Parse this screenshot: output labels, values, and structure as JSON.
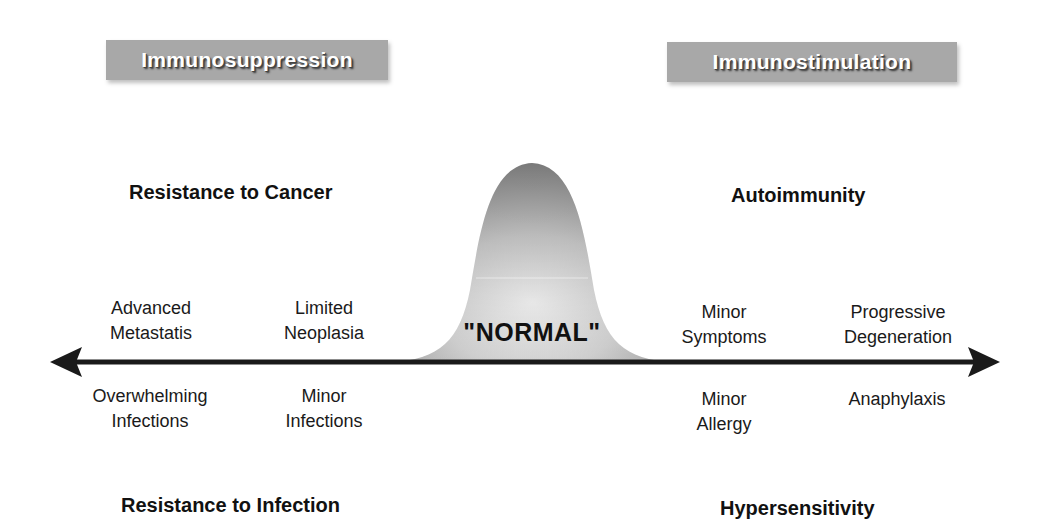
{
  "banners": {
    "left": "Immunosuppression",
    "right": "Immunostimulation"
  },
  "headings": {
    "top_left": "Resistance to Cancer",
    "top_right": "Autoimmunity",
    "bottom_left": "Resistance to Infection",
    "bottom_right": "Hypersensitivity"
  },
  "center": {
    "label": "\"NORMAL\""
  },
  "above_axis": [
    {
      "line1": "Advanced",
      "line2": "Metastatis"
    },
    {
      "line1": "Limited",
      "line2": "Neoplasia"
    },
    {
      "line1": "Minor",
      "line2": "Symptoms"
    },
    {
      "line1": "Progressive",
      "line2": "Degeneration"
    }
  ],
  "below_axis": [
    {
      "line1": "Overwhelming",
      "line2": "Infections"
    },
    {
      "line1": "Minor",
      "line2": "Infections"
    },
    {
      "line1": "Minor",
      "line2": "Allergy"
    },
    {
      "line1": "Anaphylaxis",
      "line2": ""
    }
  ],
  "colors": {
    "banner_bg": "#a8a8a8",
    "axis": "#1a1a1a",
    "curve_light": "#e6e6e6",
    "curve_dark": "#8c8c8c"
  }
}
